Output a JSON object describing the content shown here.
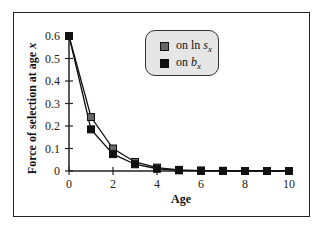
{
  "chart_data": {
    "type": "line",
    "title": "",
    "xlabel": "Age",
    "ylabel": "Force of selection at age x",
    "xlim": [
      0,
      10
    ],
    "ylim": [
      0,
      0.6
    ],
    "xticks": [
      0,
      2,
      4,
      6,
      8,
      10
    ],
    "yticks": [
      0,
      0.1,
      0.2,
      0.3,
      0.4,
      0.5,
      0.6
    ],
    "x": [
      0,
      1,
      2,
      3,
      4,
      5,
      6,
      7,
      8,
      9,
      10
    ],
    "series": [
      {
        "name": "on ln s_x",
        "color": "#666666",
        "values": [
          0.6,
          0.24,
          0.1,
          0.04,
          0.015,
          0.005,
          0.002,
          0.001,
          0.0,
          0.0,
          0.0
        ]
      },
      {
        "name": "on b_x",
        "color": "#111111",
        "values": [
          0.6,
          0.185,
          0.075,
          0.03,
          0.01,
          0.003,
          0.001,
          0.0,
          0.0,
          0.0,
          0.0
        ]
      }
    ],
    "legend_position": "upper right, inside plot",
    "grid": false
  },
  "legend": {
    "item1": {
      "prefix": "on ln ",
      "var": "s",
      "sub": "x"
    },
    "item2": {
      "prefix": "on ",
      "var": "b",
      "sub": "x"
    }
  }
}
